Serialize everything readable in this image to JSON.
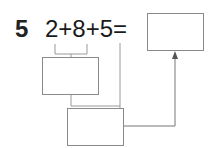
{
  "problem": {
    "number": "5",
    "expression": "2+8+5="
  },
  "boxes": {
    "answer": "",
    "first_sum": "",
    "second_sum": ""
  },
  "colors": {
    "text": "#1a1a1a",
    "line": "#8a8a8a",
    "arrow": "#555555"
  }
}
